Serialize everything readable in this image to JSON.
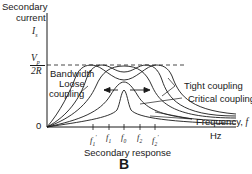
{
  "diagram": {
    "figure_label": "B",
    "caption": "Secondary response",
    "y_axis": {
      "label_line1": "Secondary",
      "label_line2": "current",
      "symbol": "I",
      "symbol_sub": "s",
      "level_numerator": "V",
      "level_numerator_sub": "p",
      "level_denominator": "2R",
      "origin": "0"
    },
    "x_axis": {
      "unit": "Hz",
      "ticks": [
        {
          "base": "f",
          "sub": "1",
          "prime": "'"
        },
        {
          "base": "f",
          "sub": "1",
          "prime": ""
        },
        {
          "base": "f",
          "sub": "0",
          "prime": ""
        },
        {
          "base": "f",
          "sub": "2",
          "prime": ""
        },
        {
          "base": "f",
          "sub": "2",
          "prime": "'"
        }
      ]
    },
    "annotations": {
      "bandwidth": "Bandwidth",
      "loose_line1": "Loose",
      "loose_line2": "coupling",
      "tight": "Tight coupling",
      "critical": "Critical coupling",
      "frequency": "Frequency, ",
      "frequency_symbol": "f"
    },
    "curves": [
      "loose-coupling",
      "intermediate-coupling",
      "critical-coupling",
      "tight-coupling",
      "over-coupled"
    ],
    "colors": {
      "line": "#1a1a1a",
      "background": "#ffffff"
    }
  }
}
